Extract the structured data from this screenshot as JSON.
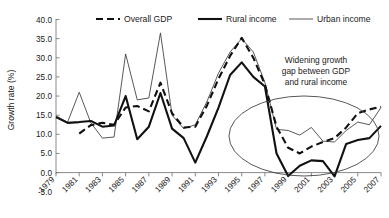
{
  "chart_data": {
    "type": "line",
    "title": "",
    "xlabel": "",
    "ylabel": "Growth rate (%)",
    "ylim": [
      -5.0,
      40.0
    ],
    "ytick_labels": [
      "40.0",
      "35.0",
      "30.0",
      "25.0",
      "20.0",
      "15.0",
      "10.0",
      "5.0",
      "0.0",
      "-5.0"
    ],
    "ytick_values": [
      40,
      35,
      30,
      25,
      20,
      15,
      10,
      5,
      0,
      -5
    ],
    "grid": false,
    "legend_position": "top",
    "xlim": [
      1979,
      2007
    ],
    "x": [
      1979,
      1980,
      1981,
      1982,
      1983,
      1984,
      1985,
      1986,
      1987,
      1988,
      1989,
      1990,
      1991,
      1992,
      1993,
      1994,
      1995,
      1996,
      1997,
      1998,
      1999,
      2000,
      2001,
      2002,
      2003,
      2004,
      2005,
      2006,
      2007
    ],
    "xtick_labels": [
      "1979",
      "1981",
      "1983",
      "1985",
      "1987",
      "1989",
      "1991",
      "1993",
      "1995",
      "1997",
      "1999",
      "2001",
      "2003",
      "2005",
      "2007"
    ],
    "xtick_values": [
      1979,
      1981,
      1983,
      1985,
      1987,
      1989,
      1991,
      1993,
      1995,
      1997,
      1999,
      2001,
      2003,
      2005,
      2007
    ],
    "series": [
      {
        "name": "Overall GDP",
        "style": "thick-dashed",
        "values": [
          null,
          null,
          10.2,
          12.4,
          13.0,
          12.5,
          17.0,
          17.4,
          16.0,
          23.5,
          15.5,
          11.8,
          12.0,
          17.5,
          24.5,
          30.5,
          35.2,
          30.0,
          23.0,
          12.0,
          6.5,
          5.0,
          6.8,
          8.0,
          9.0,
          11.8,
          15.5,
          16.5,
          17.2
        ]
      },
      {
        "name": "Rural income",
        "style": "thick-solid",
        "values": [
          14.5,
          13.0,
          13.2,
          13.5,
          12.0,
          12.3,
          20.0,
          8.7,
          12.0,
          20.8,
          11.5,
          9.0,
          2.6,
          9.5,
          17.0,
          25.5,
          28.8,
          25.0,
          22.5,
          5.0,
          -0.9,
          1.8,
          3.2,
          3.0,
          -1.0,
          7.5,
          8.5,
          9.0,
          12.2
        ]
      },
      {
        "name": "Urban income",
        "style": "thin-solid",
        "values": [
          14.8,
          13.2,
          21.0,
          13.0,
          9.0,
          9.3,
          31.0,
          19.0,
          19.5,
          36.5,
          15.0,
          11.5,
          12.5,
          18.5,
          26.0,
          31.5,
          35.0,
          31.5,
          23.5,
          11.3,
          11.0,
          9.8,
          11.8,
          8.2,
          8.0,
          11.0,
          13.2,
          12.5,
          17.0
        ]
      }
    ],
    "annotations": [
      {
        "name": "widening-gap-note",
        "lines": [
          "Widening growth",
          "gap between GDP",
          "and rural income"
        ],
        "shape": "ellipse",
        "shape_covers_x": [
          1997,
          2007
        ]
      }
    ]
  },
  "legend": {
    "items": [
      {
        "label": "Overall GDP",
        "style": "thick-dashed"
      },
      {
        "label": "Rural income",
        "style": "thick-solid"
      },
      {
        "label": "Urban income",
        "style": "thin-solid"
      }
    ]
  },
  "axes": {
    "y_title": "Growth rate (%)"
  }
}
